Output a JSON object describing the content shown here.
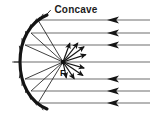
{
  "figure": {
    "title": "Concave",
    "focus_label": "F",
    "type": "optics-ray-diagram",
    "background_color": "#ffffff",
    "ray_color": "#6e6e6e",
    "mirror_color": "#141414",
    "reflected_ray_color": "#2a2a2a",
    "label_color": "#1c1c1c"
  },
  "geometry": {
    "focal_point": {
      "x": 63,
      "y": 62
    },
    "mirror": {
      "vertex": {
        "x": 20,
        "y": 62
      },
      "top_edge": {
        "x": 47,
        "y": 15
      },
      "bottom_edge": {
        "x": 47,
        "y": 109
      },
      "opens": "right"
    },
    "optical_axis_y": 62
  },
  "incoming_rays": {
    "direction": "right-to-left",
    "count": 7,
    "arrowhead": "left",
    "start_x": 150,
    "items": [
      {
        "y": 20,
        "end_x": 38,
        "has_arrowhead": true,
        "arrow_x": 112
      },
      {
        "y": 33,
        "end_x": 31,
        "has_arrowhead": true,
        "arrow_x": 112
      },
      {
        "y": 45,
        "end_x": 25,
        "has_arrowhead": true,
        "arrow_x": 112
      },
      {
        "y": 62,
        "end_x": 12,
        "has_arrowhead": false,
        "arrow_x": 0
      },
      {
        "y": 79,
        "end_x": 25,
        "has_arrowhead": true,
        "arrow_x": 112
      },
      {
        "y": 91,
        "end_x": 31,
        "has_arrowhead": true,
        "arrow_x": 112
      },
      {
        "y": 103,
        "end_x": 38,
        "has_arrowhead": true,
        "arrow_x": 112
      }
    ]
  },
  "reflected_rays": {
    "description": "rays from mirror surface converging at focal point F",
    "count": 6,
    "items": [
      {
        "from_x": 38,
        "from_y": 20
      },
      {
        "from_x": 31,
        "from_y": 33
      },
      {
        "from_x": 25,
        "from_y": 45
      },
      {
        "from_x": 25,
        "from_y": 79
      },
      {
        "from_x": 31,
        "from_y": 91
      },
      {
        "from_x": 38,
        "from_y": 103
      }
    ]
  },
  "focus_arrows": {
    "description": "short arrows radiating outward from focal point F",
    "count": 8,
    "items": [
      {
        "angle_deg": -70,
        "length": 20
      },
      {
        "angle_deg": -52,
        "length": 24
      },
      {
        "angle_deg": -36,
        "length": 26
      },
      {
        "angle_deg": -18,
        "length": 24
      },
      {
        "angle_deg": 16,
        "length": 22
      },
      {
        "angle_deg": 34,
        "length": 24
      },
      {
        "angle_deg": 56,
        "length": 20
      },
      {
        "angle_deg": 78,
        "length": 16
      }
    ]
  },
  "hatching": {
    "description": "short tick marks on the convex back of the mirror",
    "count": 13
  }
}
